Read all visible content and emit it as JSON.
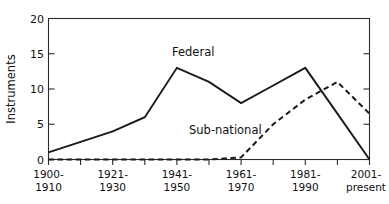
{
  "chart_data": {
    "type": "line",
    "title": "",
    "xlabel": "",
    "ylabel": "Instruments",
    "ylim": [
      0,
      20
    ],
    "yticks": [
      0,
      5,
      10,
      15,
      20
    ],
    "ytick_labels": [
      "0",
      "5",
      "10",
      "15",
      "20"
    ],
    "grid": false,
    "legend_position": "inline-annotation",
    "categories": [
      "1900-1910",
      "1911-1920",
      "1921-1930",
      "1931-1940",
      "1941-1950",
      "1951-1960",
      "1961-1970",
      "1971-1980",
      "1981-1990",
      "1991-2000",
      "2001-present"
    ],
    "xtick_labels": [
      "1900-\n1910",
      "",
      "1921-\n1930",
      "",
      "1941-\n1950",
      "",
      "1961-\n1970",
      "",
      "1981-\n1990",
      "",
      "2001-\npresent"
    ],
    "xtick_labels_shown": [
      {
        "index": 0,
        "line1": "1900-",
        "line2": "1910"
      },
      {
        "index": 2,
        "line1": "1921-",
        "line2": "1930"
      },
      {
        "index": 4,
        "line1": "1941-",
        "line2": "1950"
      },
      {
        "index": 6,
        "line1": "1961-",
        "line2": "1970"
      },
      {
        "index": 8,
        "line1": "1981-",
        "line2": "1990"
      },
      {
        "index": 10,
        "line1": "2001-",
        "line2": "present"
      }
    ],
    "series": [
      {
        "name": "Federal",
        "style": "solid",
        "color": "#1a1a1a",
        "values": [
          1,
          2.5,
          4,
          6,
          13,
          11,
          8,
          10.5,
          13,
          6.5,
          0
        ]
      },
      {
        "name": "Sub-national",
        "style": "dashed",
        "color": "#1a1a1a",
        "values": [
          0,
          0,
          0,
          0,
          0,
          0,
          0.3,
          5,
          8.5,
          11,
          6.5
        ]
      }
    ],
    "annotations": [
      {
        "text": "Federal",
        "series": "Federal",
        "x_px": 172,
        "y_px": 56
      },
      {
        "text": "Sub-national",
        "series": "Sub-national",
        "x_px": 189,
        "y_px": 134
      }
    ]
  }
}
